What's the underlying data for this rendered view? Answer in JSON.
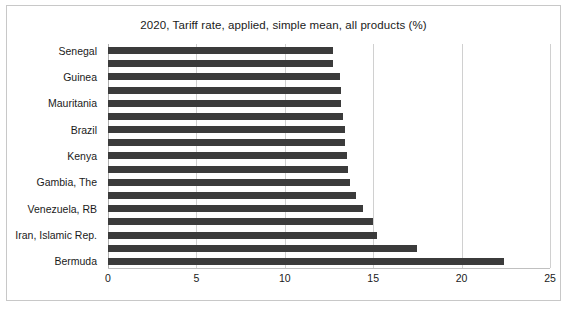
{
  "chart_data": {
    "type": "bar",
    "orientation": "horizontal",
    "title": "2020, Tariff rate, applied, simple mean, all products (%)",
    "xlabel": "",
    "ylabel": "",
    "xlim": [
      0,
      25
    ],
    "xticks": [
      "0",
      "5",
      "10",
      "15",
      "20",
      "25"
    ],
    "xtick_values": [
      0,
      5,
      10,
      15,
      20,
      25
    ],
    "grid": true,
    "legend": "none",
    "bar_color": "#3b3b3b",
    "categories": [
      "Senegal",
      "",
      "Guinea",
      "",
      "Mauritania",
      "",
      "Brazil",
      "",
      "Kenya",
      "",
      "Gambia, The",
      "",
      "Venezuela, RB",
      "",
      "Iran, Islamic Rep.",
      "",
      "Bermuda"
    ],
    "labeled_categories": [
      "Senegal",
      "Guinea",
      "Mauritania",
      "Brazil",
      "Kenya",
      "Gambia, The",
      "Venezuela, RB",
      "Iran, Islamic Rep.",
      "Bermuda"
    ],
    "values": [
      12.7,
      12.7,
      13.1,
      13.2,
      13.2,
      13.3,
      13.4,
      13.4,
      13.5,
      13.6,
      13.7,
      14.0,
      14.4,
      15.0,
      15.2,
      17.5,
      22.4
    ]
  }
}
